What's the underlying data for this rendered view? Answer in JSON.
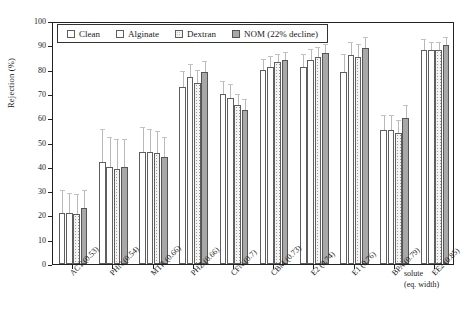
{
  "chart_data": {
    "type": "bar",
    "title": "",
    "xlabel": "solute (eq. width)",
    "ylabel": "Rejection (%)",
    "ylim": [
      0,
      100
    ],
    "ytick_step": 10,
    "yticks": [
      0,
      10,
      20,
      30,
      40,
      50,
      60,
      70,
      80,
      90,
      100
    ],
    "grid": false,
    "legend_position": "top-left-inside",
    "categories": [
      "ACT (0.53)",
      "PHN (0.54)",
      "MTR (0.66)",
      "PHZ (0.66)",
      "CFN (0.7)",
      "CBM (0.73)",
      "E2 (0.74)",
      "E1 (0.76)",
      "BPA (0.79)",
      "EE2 (0.85)"
    ],
    "series": [
      {
        "name": "Clean",
        "fill": "white",
        "values": [
          21,
          42,
          46,
          73,
          70,
          80,
          81,
          79,
          55,
          88
        ],
        "errors": [
          9,
          13,
          10,
          6,
          5,
          4,
          5,
          7,
          6,
          4
        ]
      },
      {
        "name": "Alginate",
        "fill": "white",
        "values": [
          21,
          40,
          46,
          77,
          68.5,
          81,
          84,
          86,
          55,
          88
        ],
        "errors": [
          8,
          12,
          9,
          5,
          5,
          4,
          4,
          5,
          6,
          3
        ]
      },
      {
        "name": "Dextran",
        "fill": "dotted",
        "values": [
          20.5,
          39,
          45.5,
          74.5,
          65.5,
          83,
          85,
          85,
          54,
          88
        ],
        "errors": [
          8,
          12,
          9,
          5,
          4,
          3,
          4,
          5,
          5,
          3
        ]
      },
      {
        "name": "NOM (22% decline)",
        "fill": "gray",
        "values": [
          23,
          40,
          44,
          79,
          63.5,
          84,
          87,
          89,
          60,
          90
        ],
        "errors": [
          7,
          11,
          8,
          4,
          4,
          3,
          3,
          4,
          5,
          3
        ]
      }
    ]
  },
  "legend": {
    "items": [
      {
        "label": "Clean",
        "swatch": "clean"
      },
      {
        "label": "Alginate",
        "swatch": "alginate"
      },
      {
        "label": "Dextran",
        "swatch": "dextran"
      },
      {
        "label": "NOM (22% decline)",
        "swatch": "nom"
      }
    ]
  },
  "axis": {
    "y_title": "Rejection (%)",
    "x_caption_line1": "solute",
    "x_caption_line2": "(eq. width)"
  },
  "colors": {
    "axis": "#222222",
    "bar_outline": "#5e5e5e",
    "nom_fill": "#a8a8a8",
    "dextran_dot": "#9a9a9a",
    "error_bar": "#bcbcbc",
    "background": "#ffffff"
  }
}
